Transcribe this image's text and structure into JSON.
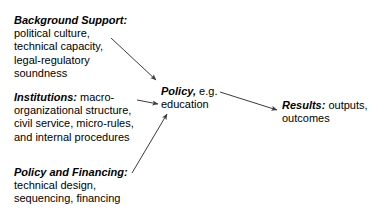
{
  "diagram": {
    "background_color": "#ffffff",
    "text_color": "#000000",
    "arrow_color": "#3c3c3c",
    "blocks": [
      {
        "id": "background_support",
        "lead": "Background Support:",
        "lines": [
          "political culture,",
          "technical capacity,",
          "legal-regulatory",
          "soundness"
        ]
      },
      {
        "id": "institutions",
        "lead": "Institutions:",
        "lead_inline_rest": " macro-",
        "lines": [
          "organizational structure,",
          "civil service, micro-rules,",
          "and internal procedures"
        ]
      },
      {
        "id": "policy_and_financing",
        "lead": "Policy and Financing:",
        "lines": [
          "technical design,",
          "sequencing, financing"
        ]
      },
      {
        "id": "policy",
        "lead": "Policy,",
        "lead_inline_rest": " e.g.",
        "lines": [
          "education"
        ]
      },
      {
        "id": "results",
        "lead": "Results:",
        "lead_inline_rest": " outputs,",
        "lines": [
          "outcomes"
        ]
      }
    ],
    "arrows": [
      {
        "id": "background-to-policy",
        "from": "background_support",
        "to": "policy",
        "x1": 111,
        "y1": 38,
        "x2": 156,
        "y2": 80
      },
      {
        "id": "institutions-to-policy",
        "from": "institutions",
        "to": "policy",
        "x1": 137,
        "y1": 100,
        "x2": 158,
        "y2": 104
      },
      {
        "id": "financing-to-policy",
        "from": "policy_and_financing",
        "to": "policy",
        "x1": 132,
        "y1": 173,
        "x2": 167,
        "y2": 114
      },
      {
        "id": "policy-to-results",
        "from": "policy",
        "to": "results",
        "x1": 220,
        "y1": 92,
        "x2": 277,
        "y2": 110
      }
    ]
  }
}
